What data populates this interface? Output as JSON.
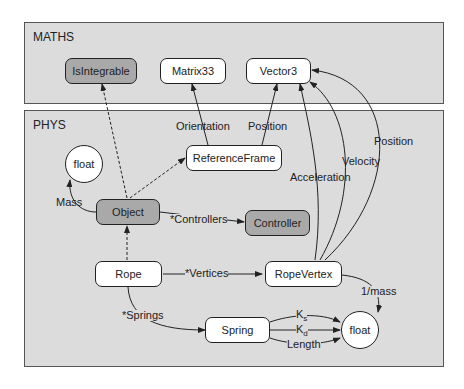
{
  "packages": {
    "maths": {
      "title": "MATHS"
    },
    "phys": {
      "title": "PHYS"
    }
  },
  "nodes": {
    "isintegrable": "IsIntegrable",
    "matrix33": "Matrix33",
    "vector3": "Vector3",
    "float_mass": "float",
    "referenceframe": "ReferenceFrame",
    "object": "Object",
    "controller": "Controller",
    "rope": "Rope",
    "ropevertex": "RopeVertex",
    "spring": "Spring",
    "float_spring": "float"
  },
  "edge_labels": {
    "orientation": "Orientation",
    "position_rf": "Position",
    "acceleration": "Acceleration",
    "velocity": "Velocity",
    "position_rv": "Position",
    "mass": "Mass",
    "controllers": "*Controllers",
    "vertices": "*Vertices",
    "springs": "*Springs",
    "one_over_mass": "1/mass",
    "ks_base": "K",
    "ks_sub": "s",
    "kd_base": "K",
    "kd_sub": "d",
    "length": "Length"
  },
  "colors": {
    "package_fill": "#dcdcdc",
    "grey_node": "#a9a9a9",
    "white_node": "#ffffff",
    "stroke": "#222222"
  }
}
